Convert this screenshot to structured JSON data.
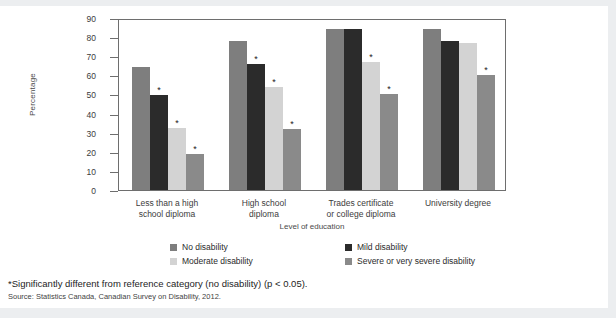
{
  "chart_data": {
    "type": "bar",
    "title": "",
    "xlabel": "Level of education",
    "ylabel": "Percentage",
    "ylim": [
      0,
      90
    ],
    "ytick_step": 10,
    "yticks": [
      0,
      10,
      20,
      30,
      40,
      50,
      60,
      70,
      80,
      90
    ],
    "grid": false,
    "legend_position": "bottom",
    "categories": [
      "Less than a high\nschool diploma",
      "High school\ndiploma",
      "Trades certificate\nor college diploma",
      "University degree"
    ],
    "category_lines": [
      [
        "Less than a high",
        "school diploma"
      ],
      [
        "High school",
        "diploma"
      ],
      [
        "Trades certificate",
        "or college diploma"
      ],
      [
        "University degree"
      ]
    ],
    "series": [
      {
        "name": "No disability",
        "color": "#7e7e7e",
        "values": [
          64.5,
          78.0,
          84.5,
          84.0
        ],
        "significant": [
          false,
          false,
          false,
          false
        ]
      },
      {
        "name": "Mild disability",
        "color": "#2b2b2b",
        "values": [
          49.5,
          66.0,
          84.5,
          78.0
        ],
        "significant": [
          true,
          true,
          false,
          false
        ]
      },
      {
        "name": "Moderate disability",
        "color": "#d3d3d3",
        "values": [
          32.5,
          54.0,
          67.0,
          77.0
        ],
        "significant": [
          true,
          true,
          true,
          false
        ]
      },
      {
        "name": "Severe or very severe disability",
        "color": "#8a8a8a",
        "values": [
          19.0,
          32.0,
          50.0,
          60.0
        ],
        "significant": [
          true,
          true,
          true,
          true
        ]
      }
    ],
    "significance_marker": "*"
  },
  "legend": {
    "items": [
      {
        "label": "No disability",
        "color": "#7e7e7e"
      },
      {
        "label": "Mild disability",
        "color": "#2b2b2b"
      },
      {
        "label": "Moderate disability",
        "color": "#d3d3d3"
      },
      {
        "label": "Severe or very severe disability",
        "color": "#8a8a8a"
      }
    ]
  },
  "footnotes": {
    "significance": "*Significantly different from reference category (no disability) (p < 0.05).",
    "source": "Source: Statistics Canada, Canadian Survey on Disability, 2012."
  },
  "colors": {
    "page_background": "#eceef0",
    "card_background": "#ffffff",
    "axis": "#6e6e6e",
    "text": "#2b2b2b"
  }
}
